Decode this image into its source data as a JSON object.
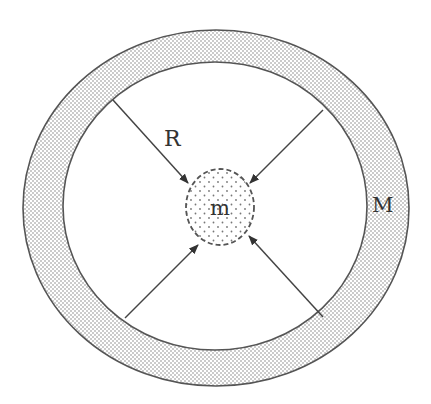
{
  "diagram": {
    "labels": {
      "radius": "R",
      "inner_mass": "m",
      "shell_mass": "M"
    },
    "shell": {
      "outer": {
        "cx": 216,
        "cy": 208,
        "rx": 193,
        "ry": 178
      },
      "inner": {
        "cx": 215,
        "cy": 206,
        "rx": 152,
        "ry": 144
      },
      "fill_pattern": "stippled-dots"
    },
    "inner_mass": {
      "cx": 220,
      "cy": 207,
      "rx": 34,
      "ry": 38,
      "border": "dashed",
      "fill_pattern": "sparse-dots"
    },
    "arrows": [
      {
        "name": "arrow-top-left",
        "from": [
          113,
          100
        ],
        "to": [
          188,
          183
        ]
      },
      {
        "name": "arrow-top-right",
        "from": [
          323,
          110
        ],
        "to": [
          250,
          183
        ]
      },
      {
        "name": "arrow-bottom-left",
        "from": [
          125,
          318
        ],
        "to": [
          198,
          245
        ]
      },
      {
        "name": "arrow-bottom-right",
        "from": [
          323,
          317
        ],
        "to": [
          249,
          236
        ]
      }
    ],
    "colors": {
      "line": "#444444",
      "dot": "#8a8a8a",
      "background": "#ffffff",
      "text": "#333333"
    }
  }
}
